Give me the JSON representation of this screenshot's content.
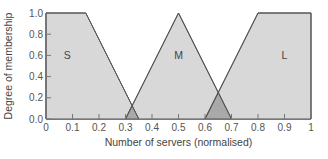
{
  "chart_data": {
    "type": "area",
    "title": "",
    "xlabel": "Number of servers (normalised)",
    "ylabel": "Degree of membership",
    "xlim": [
      0,
      1
    ],
    "ylim": [
      0,
      1
    ],
    "grid": false,
    "legend": "none",
    "x_ticks": [
      "0",
      "0.1",
      "0.2",
      "0.3",
      "0.4",
      "0.5",
      "0.6",
      "0.7",
      "0.8",
      "0.9",
      "1"
    ],
    "y_ticks": [
      "0.0",
      "0.2",
      "0.4",
      "0.6",
      "0.8",
      "1.0"
    ],
    "series": [
      {
        "name": "S",
        "label_pos": [
          0.08,
          0.6
        ],
        "points": [
          [
            0,
            0
          ],
          [
            0,
            1
          ],
          [
            0.15,
            1
          ],
          [
            0.35,
            0
          ]
        ]
      },
      {
        "name": "M",
        "label_pos": [
          0.5,
          0.6
        ],
        "points": [
          [
            0.3,
            0
          ],
          [
            0.5,
            1
          ],
          [
            0.7,
            0
          ]
        ]
      },
      {
        "name": "L",
        "label_pos": [
          0.9,
          0.6
        ],
        "points": [
          [
            0.6,
            0
          ],
          [
            0.8,
            1
          ],
          [
            1,
            1
          ],
          [
            1,
            0
          ]
        ]
      }
    ],
    "overlaps": [
      {
        "between": [
          "S",
          "M"
        ],
        "points": [
          [
            0.3,
            0
          ],
          [
            0.325,
            0.125
          ],
          [
            0.35,
            0
          ]
        ]
      },
      {
        "between": [
          "M",
          "L"
        ],
        "points": [
          [
            0.6,
            0
          ],
          [
            0.65,
            0.25
          ],
          [
            0.7,
            0
          ]
        ]
      }
    ]
  },
  "colors": {
    "fill": "#d8d8d8",
    "overlap_fill": "#a9a9a9",
    "edge": "#555555",
    "axis": "#777777",
    "text": "#444444"
  }
}
